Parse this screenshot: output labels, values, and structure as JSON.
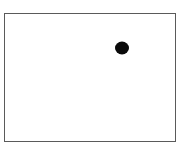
{
  "figure": {
    "frame": {
      "border_color": "#5a5a5a",
      "background": "#ffffff"
    },
    "dot": {
      "x": 117,
      "y": 34,
      "color": "#0a0a0a",
      "shape": "filled-circle"
    }
  }
}
